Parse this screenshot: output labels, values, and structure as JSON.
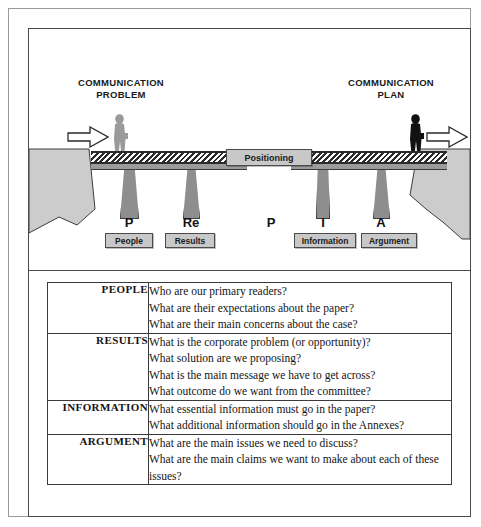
{
  "diagram": {
    "heading_left": "COMMUNICATION\nPROBLEM",
    "heading_right": "COMMUNICATION\nPLAN",
    "arrow_left_name": "arrow-right-outline-left",
    "arrow_right_name": "arrow-right-outline-right",
    "figure_left_name": "person-silhouette-gray",
    "figure_right_name": "person-silhouette-black",
    "positioning_label": "Positioning",
    "letters": [
      {
        "letter": "P",
        "badge": "People"
      },
      {
        "letter": "Re",
        "badge": "Results"
      },
      {
        "letter": "P",
        "badge": ""
      },
      {
        "letter": "I",
        "badge": "Information"
      },
      {
        "letter": "A",
        "badge": "Argument"
      }
    ],
    "colors": {
      "cliff": "#cccccc",
      "pier": "#8e8e8e",
      "badge": "#c8c8c8",
      "deck": "#2b2b2b",
      "roadbed": "#9b9b9b",
      "figure_left": "#9a9a9a",
      "figure_right": "#111111"
    }
  },
  "table": {
    "rows": [
      {
        "label": "PEOPLE",
        "questions": [
          "Who are our primary readers?",
          "What are their expectations about the paper?",
          "What are their main concerns about the case?"
        ]
      },
      {
        "label": "RESULTS",
        "questions": [
          "What is the corporate problem (or opportunity)?",
          "What solution are we proposing?",
          "What is the main message we have to get across?",
          "What outcome do we want from the committee?"
        ]
      },
      {
        "label": "INFORMATION",
        "questions": [
          "What essential information must go in the paper?",
          "What additional information should go in the Annexes?"
        ]
      },
      {
        "label": "ARGUMENT",
        "questions": [
          "What are the main issues we need to discuss?",
          "What are the main claims we want to make about each of these issues?"
        ]
      }
    ]
  }
}
